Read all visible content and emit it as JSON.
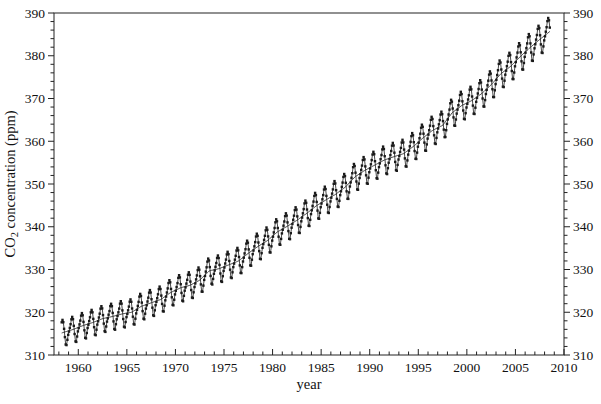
{
  "figure": {
    "kind": "scientific line chart",
    "background": "#ffffff"
  },
  "chart_data": {
    "type": "line",
    "title": "",
    "xlabel": "year",
    "ylabel": "CO2 concentration (ppm)",
    "ylabel_parts": {
      "pre": "CO",
      "sub": "2",
      "post": " concentration (ppm)"
    },
    "xlim": [
      1957.5,
      2010
    ],
    "ylim": [
      310,
      390
    ],
    "x_major_step": 5,
    "x_minor_step": 1,
    "y_major_step": 10,
    "y_minor_step": 2,
    "x_tick_labels": [
      "1960",
      "1965",
      "1970",
      "1975",
      "1980",
      "1985",
      "1990",
      "1995",
      "2000",
      "2005",
      "2010"
    ],
    "y_tick_labels": [
      "310",
      "320",
      "330",
      "340",
      "350",
      "360",
      "370",
      "380",
      "390"
    ],
    "axes_style": {
      "frame": "full box",
      "y_ticks_direction": "out",
      "x_ticks_direction": "in",
      "labels_on_right": true,
      "grid": false,
      "legend": "none"
    },
    "colors": {
      "frame": "#222222",
      "tick": "#222222",
      "text": "#111111",
      "data": "#1a1a1a",
      "trend": "#3a3a3a",
      "background": "#ffffff"
    },
    "series": [
      {
        "name": "monthly CO2 (seasonal cycle)",
        "style": "square markers connected by thin line",
        "color": "#1a1a1a"
      },
      {
        "name": "long-term trend",
        "style": "smooth thin line",
        "color": "#3a3a3a"
      }
    ],
    "monthly_model": {
      "start_year": 1958,
      "annual_means": [
        315.3,
        316.0,
        316.9,
        317.6,
        318.5,
        319.0,
        319.6,
        320.0,
        321.4,
        322.2,
        323.0,
        324.6,
        325.7,
        326.3,
        327.5,
        329.7,
        330.2,
        331.1,
        332.0,
        333.8,
        335.4,
        336.8,
        338.8,
        340.1,
        341.5,
        343.1,
        344.9,
        346.3,
        347.6,
        349.3,
        351.7,
        353.2,
        354.4,
        355.6,
        356.4,
        357.1,
        358.8,
        360.8,
        362.6,
        363.7,
        366.7,
        368.4,
        369.5,
        371.1,
        373.2,
        375.8,
        377.5,
        379.8,
        381.9,
        383.8,
        385.6
      ],
      "seasonal_anomalies_by_month": [
        -0.2,
        0.6,
        1.4,
        2.5,
        3.0,
        2.4,
        0.8,
        -1.2,
        -3.0,
        -3.2,
        -2.0,
        -0.9
      ],
      "amplitude_growth_per_year": 0.003,
      "data_start": 1958.21,
      "data_end": 2008.55
    }
  }
}
